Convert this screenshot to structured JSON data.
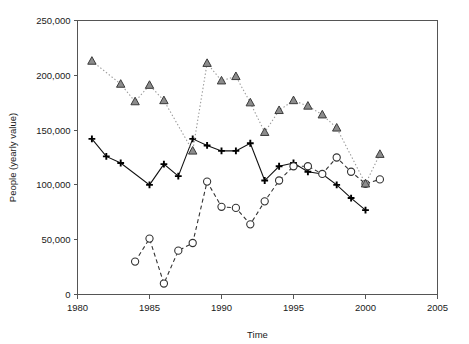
{
  "chart_data": {
    "type": "line",
    "title": "",
    "xlabel": "Time",
    "ylabel": "People (yearly value)",
    "xlim": [
      1980,
      2005
    ],
    "ylim": [
      0,
      250000
    ],
    "xticks": [
      1980,
      1985,
      1990,
      1995,
      2000,
      2005
    ],
    "xtick_labels": [
      "1980",
      "1985",
      "1990",
      "1995",
      "2000",
      "2005"
    ],
    "yticks": [
      0,
      50000,
      100000,
      150000,
      200000,
      250000
    ],
    "ytick_labels": [
      "0",
      "50,000",
      "100,000",
      "150,000",
      "200,000",
      "250,000"
    ],
    "grid": false,
    "legend": "none",
    "series": [
      {
        "name": "plus-series",
        "marker": "plus",
        "line_style": "solid",
        "color": "#111111",
        "points": [
          {
            "x": 1981,
            "y": 142000
          },
          {
            "x": 1982,
            "y": 126000
          },
          {
            "x": 1983,
            "y": 120000
          },
          {
            "x": 1985,
            "y": 100000
          },
          {
            "x": 1986,
            "y": 119000
          },
          {
            "x": 1987,
            "y": 108000
          },
          {
            "x": 1988,
            "y": 142000
          },
          {
            "x": 1989,
            "y": 136000
          },
          {
            "x": 1990,
            "y": 131000
          },
          {
            "x": 1991,
            "y": 131000
          },
          {
            "x": 1992,
            "y": 138000
          },
          {
            "x": 1993,
            "y": 104000
          },
          {
            "x": 1994,
            "y": 117000
          },
          {
            "x": 1995,
            "y": 120000
          },
          {
            "x": 1996,
            "y": 112000
          },
          {
            "x": 1997,
            "y": 110000
          },
          {
            "x": 1998,
            "y": 100000
          },
          {
            "x": 1999,
            "y": 88000
          },
          {
            "x": 2000,
            "y": 77000
          }
        ]
      },
      {
        "name": "circle-series",
        "marker": "circle",
        "line_style": "dashed",
        "color": "#333333",
        "points": [
          {
            "x": 1984,
            "y": 30000
          },
          {
            "x": 1985,
            "y": 51000
          },
          {
            "x": 1986,
            "y": 10000
          },
          {
            "x": 1987,
            "y": 40000
          },
          {
            "x": 1988,
            "y": 47000
          },
          {
            "x": 1989,
            "y": 103000
          },
          {
            "x": 1990,
            "y": 80000
          },
          {
            "x": 1991,
            "y": 79000
          },
          {
            "x": 1992,
            "y": 64000
          },
          {
            "x": 1993,
            "y": 85000
          },
          {
            "x": 1994,
            "y": 104000
          },
          {
            "x": 1995,
            "y": 117000
          },
          {
            "x": 1996,
            "y": 117000
          },
          {
            "x": 1997,
            "y": 110000
          },
          {
            "x": 1998,
            "y": 125000
          },
          {
            "x": 1999,
            "y": 112000
          },
          {
            "x": 2000,
            "y": 101000
          },
          {
            "x": 2001,
            "y": 105000
          }
        ]
      },
      {
        "name": "triangle-series",
        "marker": "triangle",
        "line_style": "dotted",
        "color": "#8c8c8c",
        "points": [
          {
            "x": 1981,
            "y": 213000
          },
          {
            "x": 1983,
            "y": 192000
          },
          {
            "x": 1984,
            "y": 176000
          },
          {
            "x": 1985,
            "y": 191000
          },
          {
            "x": 1986,
            "y": 177000
          },
          {
            "x": 1988,
            "y": 131000
          },
          {
            "x": 1989,
            "y": 211000
          },
          {
            "x": 1990,
            "y": 195000
          },
          {
            "x": 1991,
            "y": 199000
          },
          {
            "x": 1992,
            "y": 175000
          },
          {
            "x": 1993,
            "y": 148000
          },
          {
            "x": 1994,
            "y": 168000
          },
          {
            "x": 1995,
            "y": 177000
          },
          {
            "x": 1996,
            "y": 172000
          },
          {
            "x": 1997,
            "y": 164000
          },
          {
            "x": 1998,
            "y": 152000
          },
          {
            "x": 2000,
            "y": 101000
          },
          {
            "x": 2001,
            "y": 128000
          }
        ]
      }
    ]
  }
}
